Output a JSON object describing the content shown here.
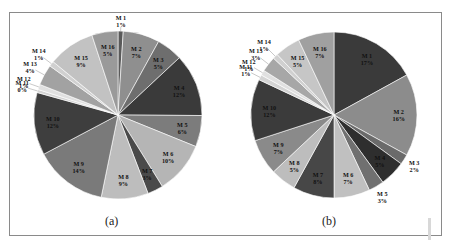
{
  "chart_data": [
    {
      "type": "pie",
      "caption": "(a)",
      "categories": [
        "M 1",
        "M 2",
        "M 3",
        "M 4",
        "M 5",
        "M 6",
        "M 7",
        "M 8",
        "M 9",
        "M 10",
        "M 11",
        "M 12",
        "M 13",
        "M 14",
        "M 15",
        "M 16"
      ],
      "values": [
        1,
        7,
        5,
        12,
        6,
        10,
        3,
        9,
        14,
        12,
        0,
        1,
        4,
        1,
        9,
        5
      ],
      "labels": [
        "1%",
        "7%",
        "5%",
        "12%",
        "6%",
        "10%",
        "3%",
        "9%",
        "14%",
        "12%",
        "0%",
        "1%",
        "4%",
        "1%",
        "9%",
        "5%"
      ],
      "colors": [
        "#5a5a5a",
        "#8f8f8f",
        "#6e6e6e",
        "#3a3a3a",
        "#7c7c7c",
        "#b5b5b5",
        "#4a4a4a",
        "#bdbdbd",
        "#7a7a7a",
        "#3e3e3e",
        "#d4d4d4",
        "#e0e0e0",
        "#a2a2a2",
        "#d0d0d0",
        "#c2c2c2",
        "#9a9a9a"
      ],
      "center": [
        118,
        115
      ],
      "radius": 84,
      "legend": "none",
      "label_position": "inside/outside with leader lines"
    },
    {
      "type": "pie",
      "caption": "(b)",
      "categories": [
        "M 1",
        "M 2",
        "M 3",
        "M 4",
        "M 5",
        "M 6",
        "M 7",
        "M 8",
        "M 9",
        "M 10",
        "M 11",
        "M 12",
        "M 13",
        "M 14",
        "M 15",
        "M 16"
      ],
      "values": [
        17,
        16,
        2,
        5,
        3,
        7,
        8,
        5,
        7,
        12,
        1,
        1,
        3,
        1,
        5,
        7
      ],
      "labels": [
        "17%",
        "16%",
        "2%",
        "5%",
        "3%",
        "7%",
        "8%",
        "5%",
        "7%",
        "12%",
        "1%",
        "1%",
        "3%",
        "1%",
        "5%",
        "7%"
      ],
      "colors": [
        "#3a3a3a",
        "#8c8c8c",
        "#6a6a6a",
        "#2e2e2e",
        "#707070",
        "#c0c0c0",
        "#474747",
        "#bdbdbd",
        "#8a8a8a",
        "#3b3b3b",
        "#d4d4d4",
        "#e0e0e0",
        "#a7a7a7",
        "#d0d0d0",
        "#c6c6c6",
        "#a0a0a0"
      ],
      "center": [
        334,
        115
      ],
      "radius": 83,
      "legend": "none",
      "label_position": "inside/outside with leader lines"
    }
  ]
}
